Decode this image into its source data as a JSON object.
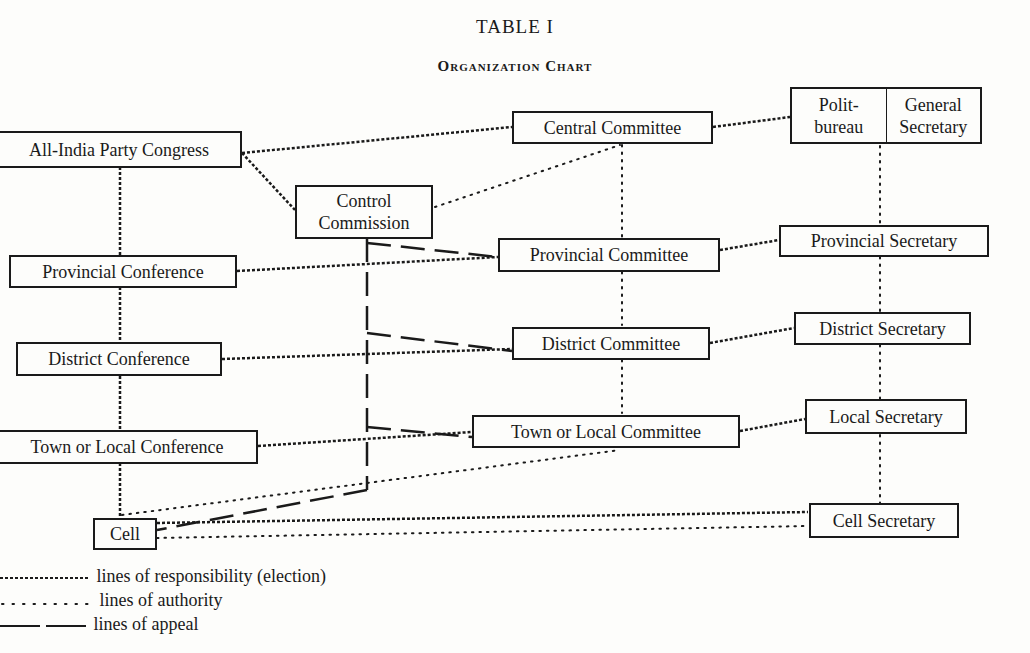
{
  "header": {
    "title": "TABLE I",
    "subtitle": "Organization Chart"
  },
  "nodes": {
    "all_india_congress": "All-India Party Congress",
    "control_commission": [
      "Control",
      "Commission"
    ],
    "central_committee": "Central Committee",
    "politbureau": [
      "Polit-",
      "bureau"
    ],
    "general_secretary": [
      "General",
      "Secretary"
    ],
    "provincial_conference": "Provincial Conference",
    "provincial_committee": "Provincial Committee",
    "provincial_secretary": "Provincial Secretary",
    "district_conference": "District  Conference",
    "district_committee": "District Committee",
    "district_secretary": "District Secretary",
    "town_conference": "Town or Local Conference",
    "town_committee": "Town or Local Committee",
    "local_secretary": "Local Secretary",
    "cell": "Cell",
    "cell_secretary": "Cell Secretary"
  },
  "legend": [
    {
      "style": "dashed-fine",
      "label": "lines of responsibility (election)"
    },
    {
      "style": "dotted",
      "label": "lines of authority"
    },
    {
      "style": "long-dash",
      "label": "lines of appeal"
    }
  ],
  "colors": {
    "ink": "#1a1a1a",
    "paper": "#fdfdfb"
  }
}
